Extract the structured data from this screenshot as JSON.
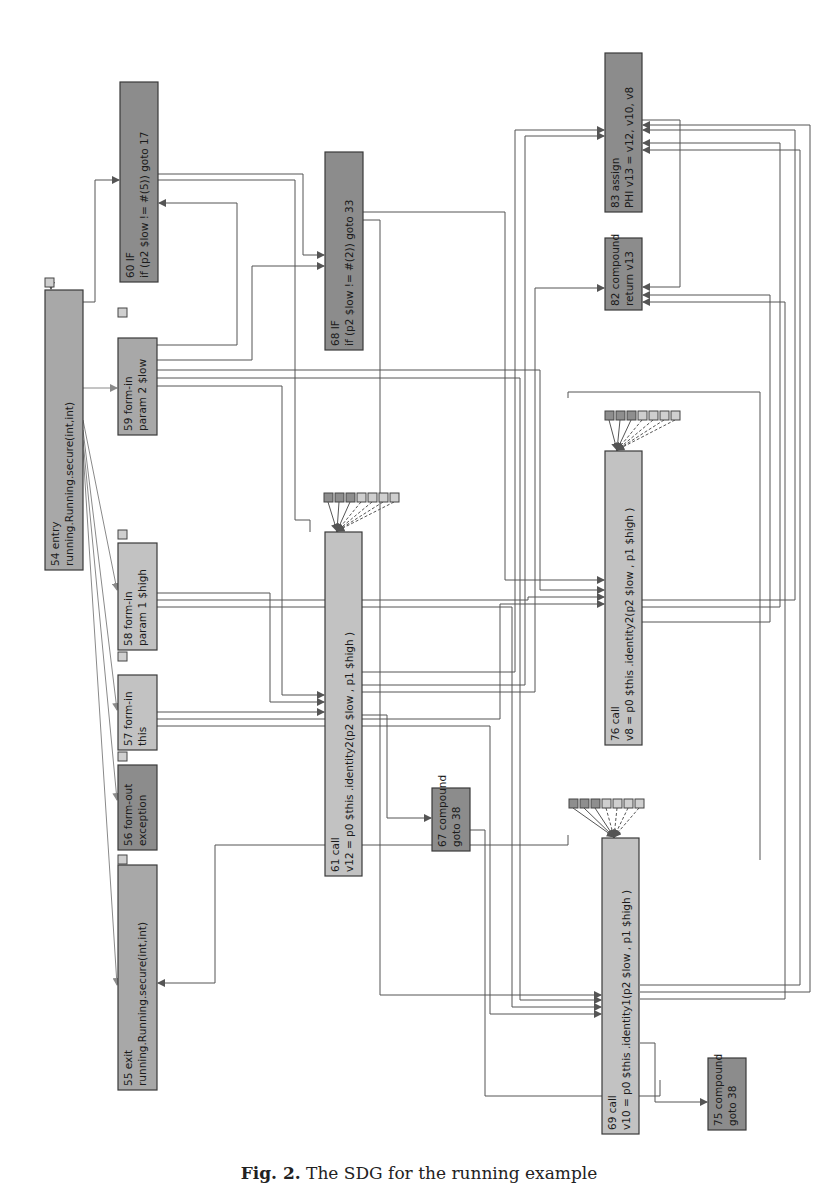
{
  "figure": {
    "caption_label": "Fig. 2.",
    "caption_text": "The SDG for the running example"
  },
  "colors": {
    "node_light": "#c2c2c2",
    "node_mid": "#a8a8a8",
    "node_dark": "#8c8c8c",
    "port_light": "#cfcfcf",
    "port_dark": "#8e8e8e",
    "edge": "#555555",
    "edge_light": "#8a8a8a"
  },
  "nodes": [
    {
      "id": "54",
      "line1": "54 entry",
      "line2": "running.Running.secure(int,int)",
      "x": 45,
      "y": 290,
      "w": 38,
      "h": 280,
      "shade": "node_mid"
    },
    {
      "id": "60",
      "line1": "60 IF",
      "line2": "if (p2 $low != #(5)) goto 17",
      "x": 120,
      "y": 82,
      "w": 38,
      "h": 200,
      "shade": "node_dark"
    },
    {
      "id": "59",
      "line1": "59 form-in",
      "line2": "param 2 $low",
      "x": 118,
      "y": 338,
      "w": 39,
      "h": 97,
      "shade": "node_mid"
    },
    {
      "id": "58",
      "line1": "58 form-in",
      "line2": "param 1 $high",
      "x": 118,
      "y": 543,
      "w": 39,
      "h": 107,
      "shade": "node_light"
    },
    {
      "id": "57",
      "line1": "57 form-in",
      "line2": "this",
      "x": 118,
      "y": 675,
      "w": 39,
      "h": 75,
      "shade": "node_light"
    },
    {
      "id": "56",
      "line1": "56 form-out",
      "line2": "exception",
      "x": 118,
      "y": 765,
      "w": 39,
      "h": 85,
      "shade": "node_dark"
    },
    {
      "id": "55",
      "line1": "55 exit",
      "line2": "running.Running.secure(int,int)",
      "x": 118,
      "y": 865,
      "w": 39,
      "h": 225,
      "shade": "node_mid"
    },
    {
      "id": "68",
      "line1": "68 IF",
      "line2": "if (p2 $low != #(2)) goto 33",
      "x": 325,
      "y": 152,
      "w": 38,
      "h": 198,
      "shade": "node_dark"
    },
    {
      "id": "61",
      "line1": "61 call",
      "line2": "v12 = p0 $this .identity2(p2 $low , p1 $high )",
      "x": 325,
      "y": 532,
      "w": 37,
      "h": 344,
      "shade": "node_light"
    },
    {
      "id": "67",
      "line1": "67 compound",
      "line2": "goto 38",
      "x": 432,
      "y": 788,
      "w": 38,
      "h": 63,
      "shade": "node_dark"
    },
    {
      "id": "83",
      "line1": "83 assign",
      "line2": "PHI v13 = v12, v10, v8",
      "x": 605,
      "y": 53,
      "w": 37,
      "h": 159,
      "shade": "node_dark"
    },
    {
      "id": "82",
      "line1": "82 compound",
      "line2": "return v13",
      "x": 605,
      "y": 238,
      "w": 37,
      "h": 72,
      "shade": "node_dark"
    },
    {
      "id": "76",
      "line1": "76 call",
      "line2": "v8 = p0 $this .identity2(p2 $low , p1 $high )",
      "x": 605,
      "y": 451,
      "w": 37,
      "h": 294,
      "shade": "node_light"
    },
    {
      "id": "69",
      "line1": "69 call",
      "line2": "v10 = p0 $this .identity1(p2 $low , p1 $high )",
      "x": 602,
      "y": 838,
      "w": 37,
      "h": 296,
      "shade": "node_light"
    },
    {
      "id": "75",
      "line1": "75 compound",
      "line2": "goto 38",
      "x": 708,
      "y": 1058,
      "w": 38,
      "h": 72,
      "shade": "node_dark"
    }
  ],
  "port_groups": [
    {
      "parent": "61",
      "x": 324,
      "y": 493,
      "count": 7
    },
    {
      "parent": "76",
      "x": 605,
      "y": 411,
      "count": 7
    },
    {
      "parent": "69",
      "x": 569,
      "y": 799,
      "count": 7
    }
  ],
  "single_ports": [
    {
      "parent": "54",
      "x": 45,
      "y": 278
    },
    {
      "parent": "59",
      "x": 118,
      "y": 308
    },
    {
      "parent": "58",
      "x": 118,
      "y": 530
    },
    {
      "parent": "57",
      "x": 118,
      "y": 652
    },
    {
      "parent": "56",
      "x": 118,
      "y": 752
    },
    {
      "parent": "55",
      "x": 118,
      "y": 855
    }
  ]
}
